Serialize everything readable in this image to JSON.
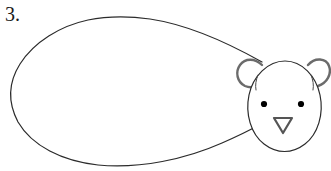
{
  "page": {
    "background_color": "#ffffff",
    "width": 331,
    "height": 171
  },
  "step": {
    "label": "3.",
    "number": 3
  },
  "illustration": {
    "title": "bear-step-3",
    "subject": "bear",
    "style": "line-drawing",
    "stroke_color": "#2b2b2b",
    "ear_stroke_color": "#666666",
    "eye_fill_color": "#000000",
    "nose_stroke_color": "#555555",
    "fill_color": "none",
    "body": {
      "name": "body-outline",
      "shape": "teardrop",
      "stroke_width": 1.2,
      "leftmost_x": 9,
      "top_y": 17,
      "bottom_y": 166,
      "rightmost_x": 262
    },
    "head": {
      "name": "head-outline",
      "shape": "oval",
      "stroke_width": 1.2,
      "center_x": 285,
      "center_y": 105,
      "radius_x": 38,
      "radius_y": 45
    },
    "ears": [
      {
        "name": "ear-left",
        "side": "left",
        "center_x": 252,
        "center_y": 73,
        "radius": 13
      },
      {
        "name": "ear-right",
        "side": "right",
        "center_x": 317,
        "center_y": 73,
        "radius": 13
      }
    ],
    "eyes": [
      {
        "name": "eye-left",
        "side": "left",
        "x": 264,
        "y": 104,
        "radius": 3.1
      },
      {
        "name": "eye-right",
        "side": "right",
        "x": 301,
        "y": 104,
        "radius": 3.1
      }
    ],
    "nose": {
      "name": "nose",
      "shape": "diamond",
      "center_x": 283,
      "center_y": 125,
      "width": 19,
      "height": 17
    }
  }
}
